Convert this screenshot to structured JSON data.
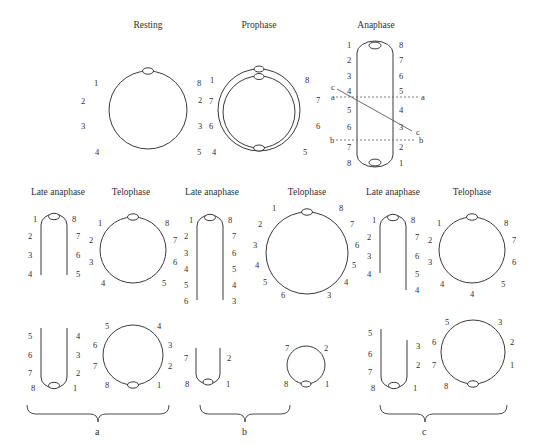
{
  "figure": {
    "background_color": "#ffffff",
    "stroke_color": "#3a3a3a",
    "text_color": "#2f2f2f",
    "width": 534,
    "height": 447
  },
  "top_row": {
    "titles": [
      {
        "label": "Resting",
        "cx": 148
      },
      {
        "label": "Prophase",
        "cx": 259
      },
      {
        "label": "Anaphase",
        "cx": 375
      }
    ],
    "resting": {
      "title": "Resting",
      "shape": "circle",
      "centromere": "top",
      "left_numbers": [
        "1",
        "2",
        "3",
        "4"
      ],
      "right_numbers": [
        "8",
        "7",
        "6",
        "5"
      ]
    },
    "prophase": {
      "title": "Prophase",
      "shape": "double-circle",
      "centromeres": [
        "top-outer",
        "top-inner",
        "bottom"
      ],
      "left_numbers": [
        "1",
        "2",
        "3",
        "4"
      ],
      "right_numbers": [
        "8",
        "7",
        "6",
        "5"
      ]
    },
    "anaphase": {
      "title": "Anaphase",
      "shape": "elongated-loop",
      "centromeres": [
        "top",
        "bottom"
      ],
      "left_numbers": [
        "1",
        "2",
        "3",
        "4",
        "5",
        "6",
        "7",
        "8"
      ],
      "right_numbers": [
        "8",
        "7",
        "6",
        "5",
        "4",
        "3",
        "2",
        "1"
      ],
      "section_lines": [
        {
          "name": "a",
          "left_label": "a",
          "right_label": "a",
          "style": "dashed-horizontal"
        },
        {
          "name": "b",
          "left_label": "b",
          "right_label": "b",
          "style": "dashed-horizontal"
        },
        {
          "name": "c",
          "left_label": "c",
          "right_label": "c",
          "style": "solid-diagonal"
        }
      ]
    }
  },
  "groups": [
    {
      "letter": "a",
      "titles": {
        "late_anaphase": "Late anaphase",
        "telophase": "Telophase"
      },
      "row1": {
        "late_anaphase": {
          "shape": "inverted-u",
          "left_numbers": [
            "1",
            "2",
            "3",
            "4"
          ],
          "right_numbers": [
            "8",
            "7",
            "6",
            "5"
          ]
        },
        "telophase": {
          "shape": "circle",
          "left_numbers": [
            "1",
            "2",
            "3",
            "4"
          ],
          "right_numbers": [
            "8",
            "7",
            "6",
            "5"
          ]
        }
      },
      "row2": {
        "late_anaphase": {
          "shape": "u",
          "left_numbers": [
            "5",
            "6",
            "7",
            "8"
          ],
          "right_numbers": [
            "4",
            "3",
            "2",
            "1"
          ]
        },
        "telophase": {
          "shape": "circle",
          "left_numbers": [
            "5",
            "6",
            "7",
            "8"
          ],
          "right_numbers": [
            "4",
            "3",
            "2",
            "1"
          ]
        }
      }
    },
    {
      "letter": "b",
      "titles": {
        "late_anaphase": "Late anaphase",
        "telophase": "Telophase"
      },
      "row1": {
        "late_anaphase": {
          "shape": "inverted-u",
          "left_numbers": [
            "1",
            "2",
            "3",
            "4",
            "5",
            "6"
          ],
          "right_numbers": [
            "8",
            "7",
            "6",
            "5",
            "4",
            "3"
          ]
        },
        "telophase": {
          "shape": "circle",
          "left_numbers": [
            "1",
            "2",
            "3",
            "4",
            "5",
            "6"
          ],
          "right_numbers": [
            "8",
            "7",
            "6",
            "5",
            "4",
            "3"
          ]
        }
      },
      "row2": {
        "late_anaphase": {
          "shape": "u",
          "left_numbers": [
            "7",
            "8"
          ],
          "right_numbers": [
            "2",
            "1"
          ]
        },
        "telophase": {
          "shape": "circle",
          "left_numbers": [
            "7",
            "8"
          ],
          "right_numbers": [
            "2",
            "1"
          ]
        }
      }
    },
    {
      "letter": "c",
      "titles": {
        "late_anaphase": "Late anaphase",
        "telophase": "Telophase"
      },
      "row1": {
        "late_anaphase": {
          "shape": "inverted-u",
          "left_numbers": [
            "1",
            "2",
            "3",
            "4"
          ],
          "right_numbers": [
            "8",
            "7",
            "6",
            "5",
            "4"
          ]
        },
        "telophase": {
          "shape": "circle",
          "left_numbers": [
            "1",
            "2",
            "3",
            "4"
          ],
          "right_numbers": [
            "8",
            "7",
            "6",
            "5"
          ],
          "extra_bottom_number": "4"
        }
      },
      "row2": {
        "late_anaphase": {
          "shape": "u",
          "left_numbers": [
            "5",
            "6",
            "7",
            "8"
          ],
          "right_numbers": [
            "3",
            "2",
            "1"
          ]
        },
        "telophase": {
          "shape": "circle",
          "left_numbers": [
            "5",
            "6",
            "7",
            "8"
          ],
          "right_numbers": [
            "3",
            "2",
            "1"
          ]
        }
      }
    }
  ],
  "braces": [
    {
      "letter": "a"
    },
    {
      "letter": "b"
    },
    {
      "letter": "c"
    }
  ],
  "labels": {
    "t_resting": "Resting",
    "t_prophase": "Prophase",
    "t_anaphase": "Anaphase",
    "t_la_a": "Late anaphase",
    "t_tel_a": "Telophase",
    "t_la_b": "Late anaphase",
    "t_tel_b": "Telophase",
    "t_la_c": "Late anaphase",
    "t_tel_c": "Telophase",
    "brace_a": "a",
    "brace_b": "b",
    "brace_c": "c",
    "r_l1": "1",
    "r_l2": "2",
    "r_l3": "3",
    "r_l4": "4",
    "r_r1": "8",
    "r_r2": "7",
    "r_r3": "6",
    "r_r4": "5",
    "p_l1": "1",
    "p_l2": "2",
    "p_l3": "3",
    "p_l4": "4",
    "p_r1": "8",
    "p_r2": "7",
    "p_r3": "6",
    "p_r4": "5",
    "an_l1": "1",
    "an_l2": "2",
    "an_l3": "3",
    "an_l4": "4",
    "an_l5": "5",
    "an_l6": "6",
    "an_l7": "7",
    "an_l8": "8",
    "an_r1": "8",
    "an_r2": "7",
    "an_r3": "6",
    "an_r4": "5",
    "an_r5": "4",
    "an_r6": "3",
    "an_r7": "2",
    "an_r8": "1",
    "an_a_left": "a",
    "an_a_right": "a",
    "an_b_left": "b",
    "an_b_right": "b",
    "an_c_left": "c",
    "an_c_right": "c",
    "a1la_l1": "1",
    "a1la_l2": "2",
    "a1la_l3": "3",
    "a1la_l4": "4",
    "a1la_r1": "8",
    "a1la_r2": "7",
    "a1la_r3": "6",
    "a1la_r4": "5",
    "a1t_l1": "1",
    "a1t_l2": "2",
    "a1t_l3": "3",
    "a1t_l4": "4",
    "a1t_r1": "8",
    "a1t_r2": "7",
    "a1t_r3": "6",
    "a1t_r4": "5",
    "a2la_l1": "5",
    "a2la_l2": "6",
    "a2la_l3": "7",
    "a2la_l4": "8",
    "a2la_r1": "4",
    "a2la_r2": "3",
    "a2la_r3": "2",
    "a2la_r4": "1",
    "a2t_l1": "5",
    "a2t_l2": "6",
    "a2t_l3": "7",
    "a2t_l4": "8",
    "a2t_r1": "4",
    "a2t_r2": "3",
    "a2t_r3": "2",
    "a2t_r4": "1",
    "b1la_l1": "1",
    "b1la_l2": "2",
    "b1la_l3": "3",
    "b1la_l4": "4",
    "b1la_l5": "5",
    "b1la_l6": "6",
    "b1la_r1": "8",
    "b1la_r2": "7",
    "b1la_r3": "6",
    "b1la_r4": "5",
    "b1la_r5": "4",
    "b1la_r6": "3",
    "b1t_l1": "1",
    "b1t_l2": "2",
    "b1t_l3": "3",
    "b1t_l4": "4",
    "b1t_l5": "5",
    "b1t_l6": "6",
    "b1t_r1": "8",
    "b1t_r2": "7",
    "b1t_r3": "6",
    "b1t_r4": "5",
    "b1t_r5": "4",
    "b1t_r6": "3",
    "b2la_l1": "7",
    "b2la_l2": "8",
    "b2la_r1": "2",
    "b2la_r2": "1",
    "b2t_l1": "7",
    "b2t_l2": "8",
    "b2t_r1": "2",
    "b2t_r2": "1",
    "c1la_l1": "1",
    "c1la_l2": "2",
    "c1la_l3": "3",
    "c1la_l4": "4",
    "c1la_r1": "8",
    "c1la_r2": "7",
    "c1la_r3": "6",
    "c1la_r4": "5",
    "c1la_r5": "4",
    "c1t_l1": "1",
    "c1t_l2": "2",
    "c1t_l3": "3",
    "c1t_l4": "4",
    "c1t_r1": "8",
    "c1t_r2": "7",
    "c1t_r3": "6",
    "c1t_r4": "5",
    "c1t_extra": "4",
    "c2la_l1": "5",
    "c2la_l2": "6",
    "c2la_l3": "7",
    "c2la_l4": "8",
    "c2la_r1": "3",
    "c2la_r2": "2",
    "c2la_r3": "1",
    "c2t_l1": "5",
    "c2t_l2": "6",
    "c2t_l3": "7",
    "c2t_l4": "8",
    "c2t_r1": "3",
    "c2t_r2": "2",
    "c2t_r3": "1"
  }
}
